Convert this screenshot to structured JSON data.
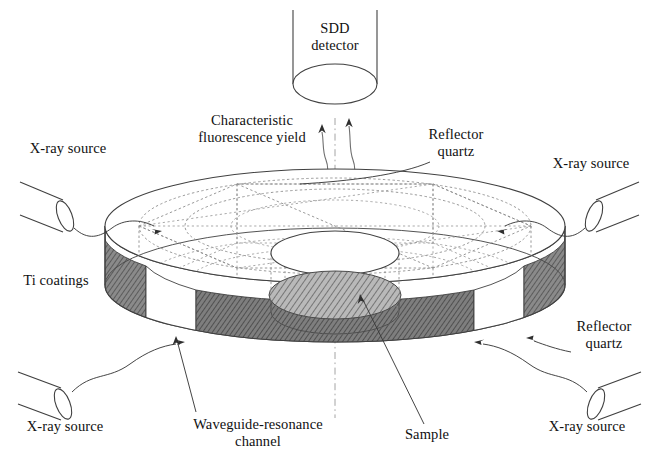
{
  "figure": {
    "type": "technical-schematic"
  },
  "colors": {
    "line": "#3a3a3a",
    "dashed": "#8d8d8d",
    "hatch": "#6e6e6e",
    "coating_fill": "#777777",
    "background": "#ffffff",
    "text": "#111111"
  },
  "labels": {
    "sdd_detector": "SDD\ndetector",
    "characteristic_fluorescence_yield": "Characteristic\nfluorescence yield",
    "reflector_quartz_top": "Reflector\nquartz",
    "reflector_quartz_bottom": "Reflector\nquartz",
    "ti_coatings": "Ti coatings",
    "waveguide_resonance_channel": "Waveguide-resonance\nchannel",
    "sample": "Sample",
    "xray_source_top_left": "X-ray source",
    "xray_source_top_right": "X-ray source",
    "xray_source_bottom_left": "X-ray source",
    "xray_source_bottom_right": "X-ray source"
  },
  "components": {
    "detector": {
      "name": "SDD detector",
      "shape": "cylinder",
      "position": "top-center"
    },
    "disc": {
      "name": "Reflector quartz disc",
      "shape": "cylindrical disc",
      "top_ellipse": {
        "cx": 335,
        "cy": 226,
        "rx": 230,
        "ry": 57
      },
      "bottom_ellipse": {
        "cx": 335,
        "cy": 285,
        "rx": 230,
        "ry": 57
      }
    },
    "well": {
      "name": "Central well",
      "top_ellipse": {
        "cx": 335,
        "cy": 253,
        "rx": 64,
        "ry": 22
      },
      "bottom_ellipse": {
        "cx": 335,
        "cy": 312,
        "rx": 64,
        "ry": 22
      }
    },
    "sample": {
      "name": "Sample",
      "shape": "hatched ellipse",
      "ellipse": {
        "cx": 335,
        "cy": 295,
        "rx": 66,
        "ry": 24
      }
    },
    "ti_coatings": {
      "name": "Ti coatings",
      "description": "Dark hatched segments on the disc rim",
      "segment_count": 3
    },
    "waveguide_channels": {
      "name": "Waveguide-resonance channel",
      "description": "White gaps between Ti coating segments on the rim",
      "segment_count": 2
    },
    "xray_sources": {
      "name": "X-ray source",
      "shape": "tilted cylinder tube",
      "count": 4,
      "positions": [
        "top-left",
        "top-right",
        "bottom-left",
        "bottom-right"
      ]
    },
    "fluorescence_beams": {
      "name": "Characteristic fluorescence yield",
      "description": "Two wavy arrows rising from the sample to the SDD detector",
      "count": 2
    }
  }
}
